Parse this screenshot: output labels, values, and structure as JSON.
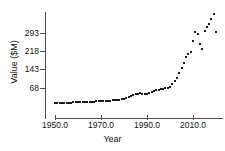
{
  "chart_data": {
    "type": "scatter",
    "title": "",
    "xlabel": "Year",
    "ylabel": "Value ($M)",
    "xlim": [
      1948,
      2021
    ],
    "ylim": [
      0,
      395
    ],
    "xticks": [
      "1950.0",
      "1970.0",
      "1990.0",
      "2010.0"
    ],
    "xtick_values": [
      1950,
      1970,
      1990,
      2010
    ],
    "yticks": [
      "68",
      "143",
      "218",
      "293"
    ],
    "ytick_values": [
      68,
      143,
      218,
      293
    ],
    "grid": false,
    "legend": null,
    "marker": "filled-square",
    "marker_color": "#1a1a1a",
    "x": [
      1950,
      1951,
      1952,
      1953,
      1954,
      1955,
      1956,
      1957,
      1958,
      1959,
      1960,
      1961,
      1962,
      1963,
      1964,
      1965,
      1966,
      1967,
      1968,
      1969,
      1970,
      1971,
      1972,
      1973,
      1974,
      1975,
      1976,
      1977,
      1978,
      1979,
      1980,
      1981,
      1982,
      1983,
      1984,
      1985,
      1986,
      1987,
      1988,
      1989,
      1990,
      1991,
      1992,
      1993,
      1994,
      1995,
      1996,
      1997,
      1998,
      1999,
      2000,
      2001,
      2002,
      2003,
      2004,
      2005,
      2006,
      2007,
      2008,
      2009,
      2010,
      2011,
      2012,
      2013,
      2014,
      2015,
      2016,
      2017,
      2018,
      2019,
      2020
    ],
    "y": [
      6,
      6,
      7,
      7,
      7,
      8,
      8,
      8,
      9,
      9,
      10,
      10,
      10,
      11,
      11,
      11,
      12,
      12,
      13,
      13,
      14,
      14,
      15,
      15,
      16,
      17,
      18,
      19,
      20,
      22,
      24,
      27,
      30,
      34,
      38,
      42,
      45,
      47,
      44,
      42,
      45,
      48,
      52,
      56,
      58,
      60,
      62,
      64,
      66,
      68,
      74,
      84,
      96,
      110,
      128,
      148,
      172,
      196,
      206,
      214,
      260,
      296,
      288,
      250,
      228,
      302,
      316,
      330,
      350,
      372,
      296
    ]
  }
}
